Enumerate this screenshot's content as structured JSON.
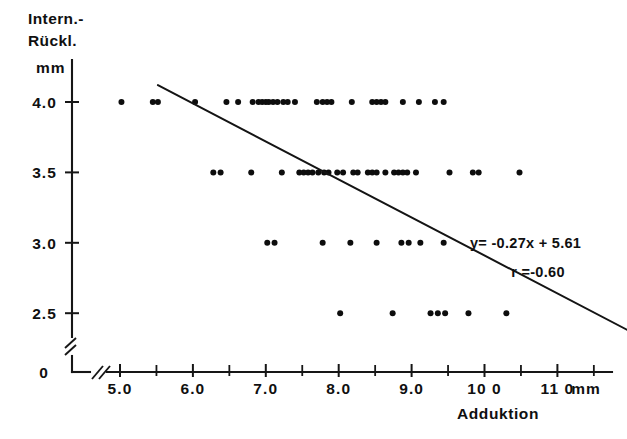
{
  "figure": {
    "background": "#ffffff",
    "ink_color": "#111111"
  },
  "yaxis": {
    "title_line1": "Intern.-",
    "title_line2": "Rückl.",
    "unit": "mm",
    "tick_labels": [
      "4.0",
      "3.5",
      "3.0",
      "2.5"
    ],
    "origin_label": "0",
    "has_break": true
  },
  "xaxis": {
    "title": "Adduktion",
    "unit": "mm",
    "tick_labels": [
      "5.0",
      "6.0",
      "7.0",
      "8.0",
      "9.0",
      "10 0",
      "11 0"
    ],
    "has_break": true
  },
  "annotations": {
    "equation": "y= -0.27x + 5.61",
    "correlation": "r =-0.60"
  },
  "chart_data": {
    "type": "scatter",
    "title": "",
    "xlabel": "Adduktion",
    "ylabel": "Intern.-Rückl.",
    "xunit": "mm",
    "yunit": "mm",
    "xlim": [
      4.4,
      11.6
    ],
    "ylim": [
      2.28,
      4.25
    ],
    "grid": false,
    "legend": null,
    "xticks": [
      5.0,
      6.0,
      7.0,
      8.0,
      9.0,
      10.0,
      11.0
    ],
    "xminorticks": [
      5.5,
      6.5,
      7.5,
      8.5,
      9.5,
      10.5,
      11.5
    ],
    "yticks": [
      2.5,
      3.0,
      3.5,
      4.0
    ],
    "regression": {
      "slope": -0.27,
      "intercept": 5.61,
      "r": -0.6,
      "x_start": 5.52,
      "x_end": 11.96,
      "label_equation": "y= -0.27x + 5.61",
      "label_correlation": "r =-0.60"
    },
    "points": [
      {
        "x": 5.02,
        "y": 4.0
      },
      {
        "x": 5.45,
        "y": 4.0
      },
      {
        "x": 5.52,
        "y": 4.0
      },
      {
        "x": 6.03,
        "y": 4.0
      },
      {
        "x": 6.46,
        "y": 4.0
      },
      {
        "x": 6.62,
        "y": 4.0
      },
      {
        "x": 6.82,
        "y": 4.0
      },
      {
        "x": 6.9,
        "y": 4.0
      },
      {
        "x": 6.95,
        "y": 4.0
      },
      {
        "x": 7.0,
        "y": 4.0
      },
      {
        "x": 7.04,
        "y": 4.0
      },
      {
        "x": 7.1,
        "y": 4.0
      },
      {
        "x": 7.16,
        "y": 4.0
      },
      {
        "x": 7.24,
        "y": 4.0
      },
      {
        "x": 7.3,
        "y": 4.0
      },
      {
        "x": 7.4,
        "y": 4.0
      },
      {
        "x": 7.7,
        "y": 4.0
      },
      {
        "x": 7.78,
        "y": 4.0
      },
      {
        "x": 7.84,
        "y": 4.0
      },
      {
        "x": 7.9,
        "y": 4.0
      },
      {
        "x": 8.18,
        "y": 4.0
      },
      {
        "x": 8.46,
        "y": 4.0
      },
      {
        "x": 8.52,
        "y": 4.0
      },
      {
        "x": 8.58,
        "y": 4.0
      },
      {
        "x": 8.64,
        "y": 4.0
      },
      {
        "x": 8.88,
        "y": 4.0
      },
      {
        "x": 9.1,
        "y": 4.0
      },
      {
        "x": 9.32,
        "y": 4.0
      },
      {
        "x": 9.44,
        "y": 4.0
      },
      {
        "x": 6.28,
        "y": 3.5
      },
      {
        "x": 6.38,
        "y": 3.5
      },
      {
        "x": 6.8,
        "y": 3.5
      },
      {
        "x": 7.22,
        "y": 3.5
      },
      {
        "x": 7.46,
        "y": 3.5
      },
      {
        "x": 7.52,
        "y": 3.5
      },
      {
        "x": 7.58,
        "y": 3.5
      },
      {
        "x": 7.64,
        "y": 3.5
      },
      {
        "x": 7.72,
        "y": 3.5
      },
      {
        "x": 7.8,
        "y": 3.5
      },
      {
        "x": 7.86,
        "y": 3.5
      },
      {
        "x": 7.98,
        "y": 3.5
      },
      {
        "x": 8.06,
        "y": 3.5
      },
      {
        "x": 8.2,
        "y": 3.5
      },
      {
        "x": 8.26,
        "y": 3.5
      },
      {
        "x": 8.4,
        "y": 3.5
      },
      {
        "x": 8.46,
        "y": 3.5
      },
      {
        "x": 8.52,
        "y": 3.5
      },
      {
        "x": 8.64,
        "y": 3.5
      },
      {
        "x": 8.76,
        "y": 3.5
      },
      {
        "x": 8.82,
        "y": 3.5
      },
      {
        "x": 8.88,
        "y": 3.5
      },
      {
        "x": 8.94,
        "y": 3.5
      },
      {
        "x": 9.06,
        "y": 3.5
      },
      {
        "x": 9.52,
        "y": 3.5
      },
      {
        "x": 9.84,
        "y": 3.5
      },
      {
        "x": 9.92,
        "y": 3.5
      },
      {
        "x": 10.48,
        "y": 3.5
      },
      {
        "x": 7.02,
        "y": 3.0
      },
      {
        "x": 7.12,
        "y": 3.0
      },
      {
        "x": 7.78,
        "y": 3.0
      },
      {
        "x": 8.16,
        "y": 3.0
      },
      {
        "x": 8.52,
        "y": 3.0
      },
      {
        "x": 8.86,
        "y": 3.0
      },
      {
        "x": 8.96,
        "y": 3.0
      },
      {
        "x": 9.12,
        "y": 3.0
      },
      {
        "x": 9.44,
        "y": 3.0
      },
      {
        "x": 8.02,
        "y": 2.5
      },
      {
        "x": 8.74,
        "y": 2.5
      },
      {
        "x": 9.26,
        "y": 2.5
      },
      {
        "x": 9.36,
        "y": 2.5
      },
      {
        "x": 9.46,
        "y": 2.5
      },
      {
        "x": 9.78,
        "y": 2.5
      },
      {
        "x": 10.3,
        "y": 2.5
      }
    ]
  }
}
